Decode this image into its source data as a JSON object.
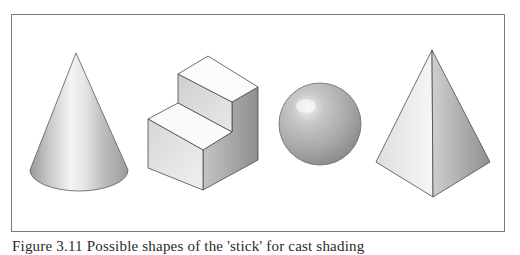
{
  "figure": {
    "caption": "Figure 3.11 Possible shapes of the 'stick' for cast shading",
    "shapes": [
      {
        "name": "cone",
        "label": "Cone"
      },
      {
        "name": "stepped-block",
        "label": "Stepped block"
      },
      {
        "name": "sphere",
        "label": "Sphere"
      },
      {
        "name": "pyramid",
        "label": "Pyramid"
      }
    ],
    "colors": {
      "frame": "#7a7a7a",
      "outline": "#5a5a5a",
      "light": "#f2f2f2",
      "mid": "#c8c8c8",
      "dark": "#8c8c8c"
    }
  }
}
